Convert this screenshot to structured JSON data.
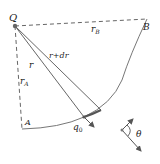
{
  "diagram": {
    "labels": {
      "Q": "Q",
      "A": "A",
      "B": "B",
      "r": "r",
      "r_dr": "r+dr",
      "rA_main": "r",
      "rA_sub": "A",
      "rB_main": "r",
      "rB_sub": "B",
      "q0_main": "q",
      "q0_sub": "0",
      "theta": "θ"
    },
    "points": {
      "Q": [
        15,
        26
      ],
      "A": [
        22,
        129
      ],
      "B": [
        147,
        19
      ],
      "q0": [
        84,
        117
      ],
      "r_dr_end": [
        101,
        110
      ]
    },
    "colors": {
      "line": "#555555",
      "dashed": "#666666",
      "text": "#222222"
    }
  }
}
